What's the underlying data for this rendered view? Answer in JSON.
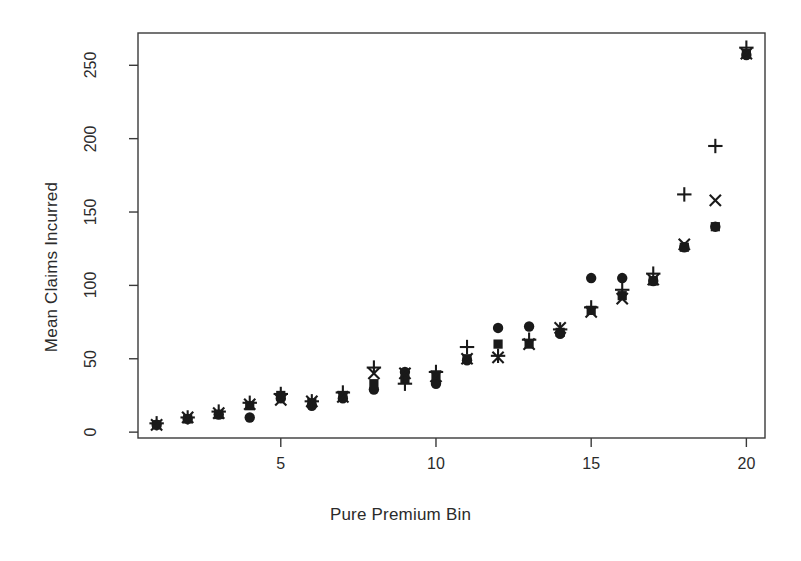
{
  "chart_data": {
    "type": "scatter",
    "title": "",
    "xlabel": "Pure Premium Bin",
    "ylabel": "Mean Claims Incurred",
    "x": [
      1,
      2,
      3,
      4,
      5,
      6,
      7,
      8,
      9,
      10,
      11,
      12,
      13,
      14,
      15,
      16,
      17,
      18,
      19,
      20
    ],
    "xlim": [
      0.4,
      20.6
    ],
    "ylim": [
      -4,
      272
    ],
    "xticks": [
      5,
      10,
      15,
      20
    ],
    "xtick_labels": [
      "5",
      "10",
      "15",
      "20"
    ],
    "yticks": [
      0,
      50,
      100,
      150,
      200,
      250
    ],
    "ytick_labels": [
      "0",
      "50",
      "100",
      "150",
      "200",
      "250"
    ],
    "grid": false,
    "legend": "none",
    "marker_color": "#1a1a1a",
    "series": [
      {
        "name": "circle",
        "marker": "filled-circle",
        "values": [
          5,
          9,
          12,
          10,
          23,
          18,
          23,
          29,
          41,
          33,
          49,
          71,
          72,
          67,
          105,
          105,
          103,
          126,
          140,
          257
        ]
      },
      {
        "name": "square",
        "marker": "filled-square",
        "values": [
          5,
          9,
          12,
          18,
          25,
          20,
          25,
          33,
          36,
          39,
          50,
          60,
          60,
          68,
          83,
          93,
          103,
          126,
          140,
          258
        ]
      },
      {
        "name": "plus",
        "marker": "plus",
        "values": [
          6,
          10,
          14,
          20,
          26,
          21,
          27,
          44,
          33,
          41,
          58,
          52,
          63,
          70,
          85,
          97,
          108,
          162,
          195,
          262
        ]
      },
      {
        "name": "cross",
        "marker": "cross",
        "values": [
          5,
          10,
          13,
          19,
          22,
          21,
          24,
          40,
          40,
          38,
          50,
          51,
          60,
          71,
          82,
          91,
          104,
          128,
          158,
          258
        ]
      }
    ]
  },
  "axes": {
    "box_color": "#3a3a3a"
  }
}
